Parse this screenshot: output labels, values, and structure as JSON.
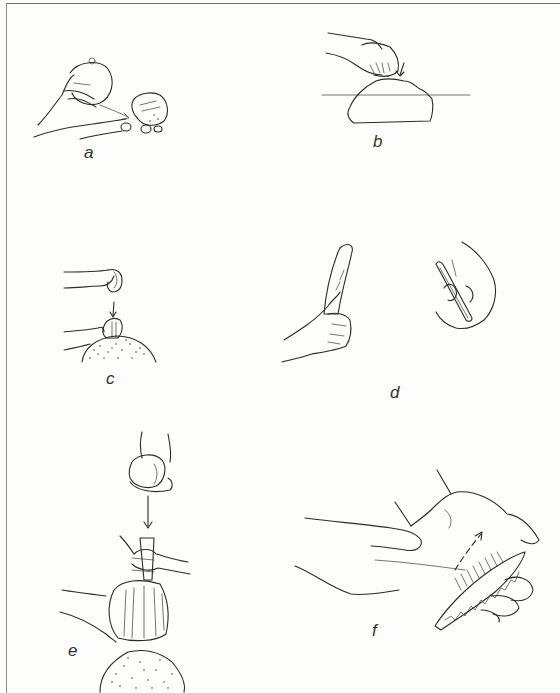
{
  "figure": {
    "ink_color": "#2a2a2a",
    "background_color": "#fdfdfc",
    "border_color": "#6e6e6e",
    "panels": [
      {
        "id": "a",
        "label": "a",
        "depicts": "hand holding round hammerstone striking a core held in other hand (direct percussion)"
      },
      {
        "id": "b",
        "label": "b",
        "depicts": "hand striking a core resting on an anvil/surface line, arrow indicating blow"
      },
      {
        "id": "c",
        "label": "c",
        "depicts": "hammerstone descending onto a core held against a stippled anvil stone, arrow downward"
      },
      {
        "id": "d",
        "label": "d",
        "depicts": "one hand gripping a bone/antler baton; other hand holding a slender pressure-flaking tool"
      },
      {
        "id": "e",
        "label": "e",
        "depicts": "hammerstone striking a punch held on a fluted core resting on a stippled anvil (indirect percussion)"
      },
      {
        "id": "f",
        "label": "f",
        "depicts": "pressure flaking a serrated blade held in a padded palm, dashed arrow showing flake direction"
      }
    ]
  }
}
